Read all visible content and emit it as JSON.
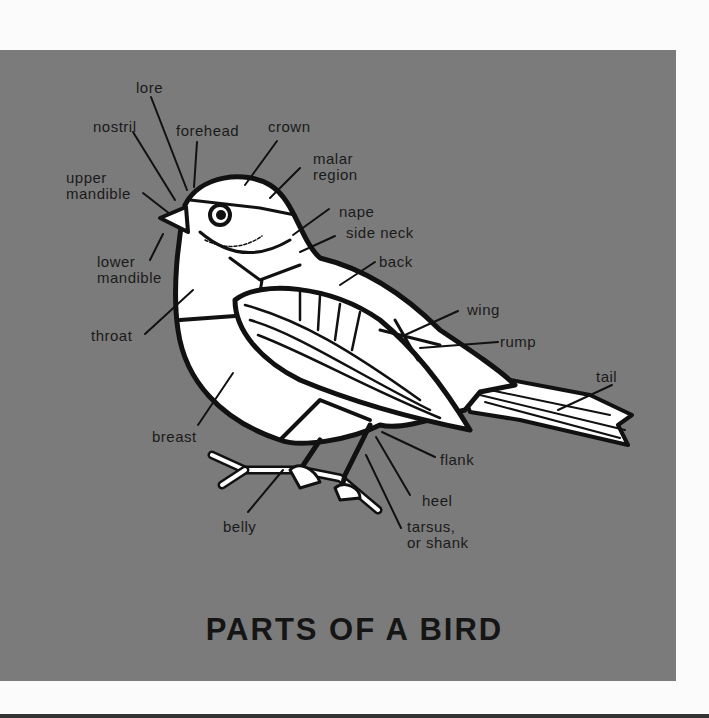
{
  "diagram": {
    "title": "PARTS OF A BIRD",
    "labels": {
      "lore": "lore",
      "nostril": "nostril",
      "forehead": "forehead",
      "crown": "crown",
      "malar_region": "malar\nregion",
      "upper_mandible": "upper\nmandible",
      "nape": "nape",
      "side_neck": "side neck",
      "back": "back",
      "lower_mandible": "lower\nmandible",
      "wing": "wing",
      "rump": "rump",
      "throat": "throat",
      "tail": "tail",
      "breast": "breast",
      "flank": "flank",
      "heel": "heel",
      "belly": "belly",
      "tarsus": "tarsus,\nor shank"
    },
    "colors": {
      "background": "#7b7b7b",
      "bird_fill": "#ffffff",
      "outline": "#111111",
      "page": "#fbfbfb"
    }
  }
}
